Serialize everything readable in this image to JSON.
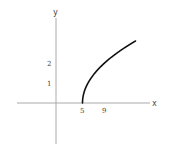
{
  "chart_data": {
    "type": "line",
    "title": "",
    "function": "y = sqrt(x - 5)",
    "xlabel": "x",
    "ylabel": "y",
    "x_ticks": [
      5,
      9
    ],
    "y_ticks": [
      1,
      2
    ],
    "series": [
      {
        "name": "sqrt(x-5)",
        "x": [
          5,
          5.25,
          5.5,
          6,
          7,
          8,
          9,
          10,
          11,
          12,
          13,
          14,
          15
        ],
        "y": [
          0,
          0.5,
          0.707,
          1,
          1.414,
          1.732,
          2,
          2.236,
          2.449,
          2.646,
          2.828,
          3,
          3.162
        ]
      }
    ],
    "xlim": [
      -7,
      17.5
    ],
    "ylim": [
      -2,
      4.7
    ],
    "grid": false,
    "legend": false
  },
  "labels": {
    "x_axis": "x",
    "y_axis": "y",
    "tick_x_1": "5",
    "tick_x_2": "9",
    "tick_y_1": "1",
    "tick_y_2": "2"
  }
}
